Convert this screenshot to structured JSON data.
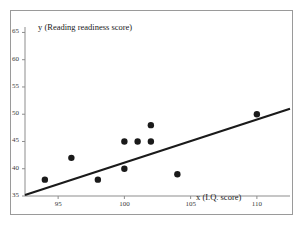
{
  "chart_data": {
    "type": "scatter",
    "title": "",
    "xlabel": "x (I.Q. score)",
    "ylabel": "y (Reading readiness score)",
    "xlim": [
      92.5,
      112.5
    ],
    "ylim": [
      35,
      66
    ],
    "xticks": [
      95,
      100,
      105,
      110
    ],
    "yticks": [
      35,
      40,
      45,
      50,
      55,
      60,
      65
    ],
    "grid": false,
    "legend": null,
    "points": [
      {
        "x": 94,
        "y": 38
      },
      {
        "x": 96,
        "y": 42
      },
      {
        "x": 98,
        "y": 38
      },
      {
        "x": 100,
        "y": 40
      },
      {
        "x": 100,
        "y": 45
      },
      {
        "x": 101,
        "y": 45
      },
      {
        "x": 102,
        "y": 45
      },
      {
        "x": 102,
        "y": 48
      },
      {
        "x": 104,
        "y": 39
      },
      {
        "x": 110,
        "y": 50
      }
    ],
    "trendline": {
      "type": "line",
      "x0": 92.5,
      "y0": 35.2,
      "x1": 112.5,
      "y1": 51.0
    },
    "marker": {
      "shape": "circle",
      "color": "#1a1a1a",
      "size": 3.2
    },
    "line_color": "#1a1a1a"
  },
  "figure": {
    "border_color": "#9a9a9a",
    "background": "#ffffff"
  }
}
